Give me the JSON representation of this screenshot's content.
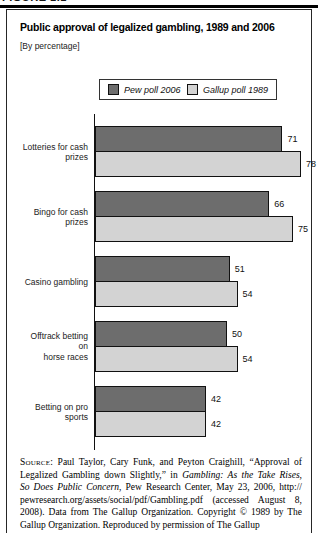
{
  "figure": {
    "page_heading": "FIGURE 1.1",
    "title": "Public approval of legalized gambling, 1989 and 2006",
    "subtitle": "[By percentage]"
  },
  "chart_data": {
    "type": "bar",
    "orientation": "horizontal",
    "title": "Public approval of legalized gambling, 1989 and 2006",
    "unit": "percent",
    "xlim": [
      0,
      100
    ],
    "legend_position": "top",
    "value_labels_shown": true,
    "categories": [
      "Lotteries for cash prizes",
      "Bingo for cash prizes",
      "Casino gambling",
      "Offtrack betting on horse races",
      "Betting on pro sports"
    ],
    "category_lines": [
      [
        "Lotteries for cash",
        "prizes"
      ],
      [
        "Bingo for cash",
        "prizes"
      ],
      [
        "Casino gambling"
      ],
      [
        "Offtrack betting on",
        "horse races"
      ],
      [
        "Betting on pro sports"
      ]
    ],
    "series": [
      {
        "name": "Pew poll 2006",
        "color": "#6d6d6d",
        "values": [
          71,
          66,
          51,
          50,
          42
        ]
      },
      {
        "name": "Gallup poll 1989",
        "color": "#d3d3d3",
        "values": [
          78,
          75,
          54,
          54,
          42
        ]
      }
    ]
  },
  "source": {
    "lines": [
      [
        [
          "sc",
          "Source:"
        ],
        [
          "r",
          " Paul Taylor, Cary Funk, and Peyton Craighill, “Approval of"
        ]
      ],
      [
        [
          "r",
          "Legalized Gambling down Slightly,” in "
        ],
        [
          "i",
          "Gambling: As the Take Rises,"
        ]
      ],
      [
        [
          "i",
          "So Does Public Concern"
        ],
        [
          "r",
          ", Pew Research Center, May 23, 2006, http://"
        ]
      ],
      [
        [
          "r",
          "pewresearch.org/assets/social/pdf/Gambling.pdf (accessed August 8,"
        ]
      ],
      [
        [
          "r",
          "2008). Data from The Gallup Organization. Copyright © 1989 by The"
        ]
      ],
      [
        [
          "r",
          "Gallup Organization. Reproduced by permission of The Gallup"
        ]
      ]
    ]
  }
}
